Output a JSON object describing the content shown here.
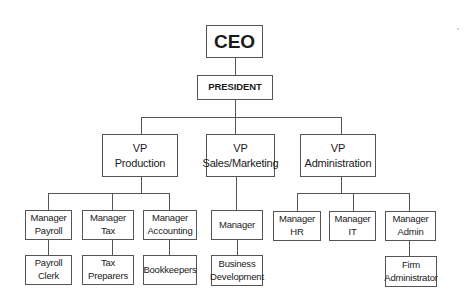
{
  "chart": {
    "ceo": {
      "lines": [
        "CEO"
      ]
    },
    "president": {
      "lines": [
        "PRESIDENT"
      ]
    },
    "vps": [
      {
        "lines": [
          "VP",
          "Production"
        ]
      },
      {
        "lines": [
          "VP",
          "Sales/Marketing"
        ]
      },
      {
        "lines": [
          "VP",
          "Administration"
        ]
      }
    ],
    "managers": [
      {
        "lines": [
          "Manager",
          "Payroll"
        ]
      },
      {
        "lines": [
          "Manager",
          "Tax"
        ]
      },
      {
        "lines": [
          "Manager",
          "Accounting"
        ]
      },
      {
        "lines": [
          "Manager"
        ]
      },
      {
        "lines": [
          "Manager",
          "HR"
        ]
      },
      {
        "lines": [
          "Manager",
          "IT"
        ]
      },
      {
        "lines": [
          "Manager",
          "Admin"
        ]
      }
    ],
    "staff": [
      {
        "lines": [
          "Payroll",
          "Clerk"
        ]
      },
      {
        "lines": [
          "Tax Preparers"
        ]
      },
      {
        "lines": [
          "Bookkeepers"
        ]
      },
      {
        "lines": [
          "Business",
          "Development"
        ]
      },
      {
        "lines": [
          "Firm",
          "Administrator"
        ]
      }
    ]
  }
}
